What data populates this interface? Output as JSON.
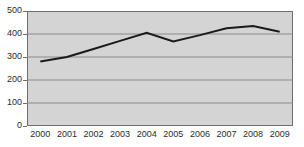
{
  "chart_data": {
    "type": "line",
    "title": "",
    "xlabel": "",
    "ylabel": "",
    "categories": [
      "2000",
      "2001",
      "2002",
      "2003",
      "2004",
      "2005",
      "2006",
      "2007",
      "2008",
      "2009"
    ],
    "values": [
      280,
      300,
      335,
      370,
      405,
      368,
      395,
      425,
      435,
      410
    ],
    "series": [
      {
        "name": "",
        "values": [
          280,
          300,
          335,
          370,
          405,
          368,
          395,
          425,
          435,
          410
        ]
      }
    ],
    "ylim": [
      0,
      500
    ],
    "y_ticks": [
      0,
      100,
      200,
      300,
      400,
      500
    ],
    "y_tick_labels": [
      "0",
      "100",
      "200",
      "300",
      "400",
      "500"
    ],
    "x_tick_labels": [
      "2000",
      "2001",
      "2002",
      "2003",
      "2004",
      "2005",
      "2006",
      "2007",
      "2008",
      "2009"
    ],
    "grid": true,
    "grid_axis": "y",
    "legend": false,
    "legend_position": "none",
    "line_color": "#1a1a1a",
    "plot_background_color": "#d4d4d4",
    "gridline_color": "#8a8a8a",
    "axis_color": "#6e6e6e",
    "text_color": "#2b2b2b",
    "figure_background_color": "#ffffff",
    "markers": false,
    "line_width": 2
  }
}
